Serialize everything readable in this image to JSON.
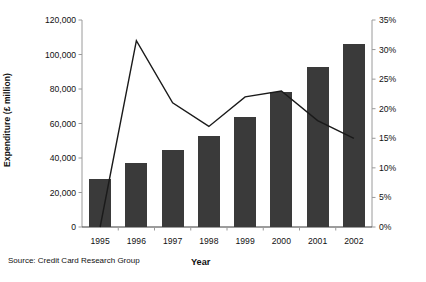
{
  "chart_data": {
    "type": "bar",
    "title": "",
    "xlabel": "Year",
    "ylabel": "Expenditure (£ million)",
    "y2label": "",
    "categories": [
      "1995",
      "1996",
      "1997",
      "1998",
      "1999",
      "2000",
      "2001",
      "2002"
    ],
    "ylim": [
      0,
      120000
    ],
    "yticks": [
      0,
      20000,
      40000,
      60000,
      80000,
      100000,
      120000
    ],
    "ytick_labels": [
      "0",
      "20,000",
      "40,000",
      "60,000",
      "80,000",
      "100,000",
      "120,000"
    ],
    "y2lim": [
      0,
      35
    ],
    "y2ticks": [
      0,
      5,
      10,
      15,
      20,
      25,
      30,
      35
    ],
    "y2tick_labels": [
      "0%",
      "5%",
      "10%",
      "15%",
      "20%",
      "25%",
      "30%",
      "35%"
    ],
    "grid": false,
    "legend": "none",
    "series": [
      {
        "name": "Expenditure (£ million)",
        "type": "bar",
        "axis": "left",
        "color": "#3a3a3a",
        "values": [
          28000,
          37000,
          44500,
          53000,
          64000,
          78000,
          93000,
          106000
        ]
      },
      {
        "name": "Annual growth (%)",
        "type": "line",
        "axis": "right",
        "color": "#1a1a1a",
        "values": [
          0,
          31.5,
          21.0,
          17.0,
          22.0,
          23.0,
          18.0,
          15.0
        ]
      }
    ],
    "source": "Source: Credit Card Research Group"
  }
}
